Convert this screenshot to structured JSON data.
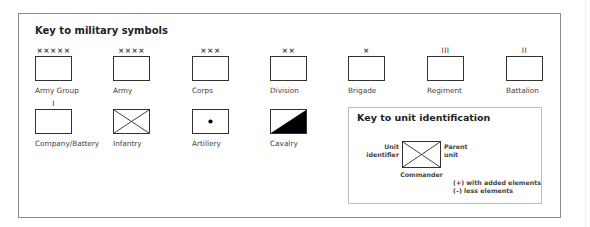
{
  "military_key": {
    "title": "Key to military symbols",
    "row1": [
      {
        "label": "Army Group",
        "echelon": "×××××"
      },
      {
        "label": "Army",
        "echelon": "××××"
      },
      {
        "label": "Corps",
        "echelon": "×××"
      },
      {
        "label": "Division",
        "echelon": "××"
      },
      {
        "label": "Brigade",
        "echelon": "×"
      },
      {
        "label": "Regiment",
        "echelon": "III"
      },
      {
        "label": "Battalion",
        "echelon": "II"
      }
    ],
    "row2": [
      {
        "label": "Company/Battery",
        "echelon": "I",
        "symbol": "plain-box-icon"
      },
      {
        "label": "Infantry",
        "echelon": "",
        "symbol": "crossed-box-icon"
      },
      {
        "label": "Artillery",
        "echelon": "",
        "symbol": "dot-box-icon"
      },
      {
        "label": "Cavalry",
        "echelon": "",
        "symbol": "diagonal-fill-box-icon"
      }
    ]
  },
  "unit_id_key": {
    "title": "Key to unit identification",
    "left_label_line1": "Unit",
    "left_label_line2": "identifier",
    "right_label_line1": "Parent",
    "right_label_line2": "unit",
    "bottom_label": "Commander",
    "note1": "(+) with added elements",
    "note2": "(–) less elements"
  },
  "colors": {
    "border": "#333333",
    "frame": "#8a8a8a",
    "inner_frame": "#bdbdbd",
    "fill": "#000000"
  }
}
